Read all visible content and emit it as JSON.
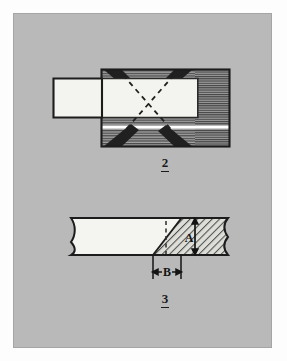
{
  "drawing": {
    "title": "Joint construction detail",
    "background_color": "#b9b9b9",
    "page_color": "#fdfdfd",
    "ink_color": "#1a1a1a",
    "figures": [
      {
        "id": "figure-2",
        "label": "2",
        "caption_underlined": true,
        "view": "plan section of mortise socket with inserted tongue",
        "parts": [
          {
            "name": "socket-body",
            "fill": "horizontal-hatch",
            "color": "#8f8f8f"
          },
          {
            "name": "end-grain-block",
            "fill": "dense-horizontal-hatch",
            "color": "#8a8a8a"
          },
          {
            "name": "tongue",
            "fill": "solid-white",
            "color": "#f2f2ee"
          },
          {
            "name": "glue-line",
            "fill": "white-line",
            "color": "#ffffff"
          }
        ],
        "annotations": [
          {
            "name": "dashed-cross-lines",
            "style": "dashed",
            "count": 2
          },
          {
            "name": "dark-diagonal-wedges",
            "count": 4,
            "color": "#242424"
          }
        ]
      },
      {
        "id": "figure-3",
        "label": "3",
        "caption_underlined": true,
        "view": "side elevation of scarf joint with break lines",
        "parts": [
          {
            "name": "plain-member",
            "fill": "solid-white",
            "color": "#f4f4f0"
          },
          {
            "name": "scarfed-member",
            "fill": "diagonal-hatch",
            "color": "#dcdcd6"
          }
        ],
        "annotations": [
          {
            "name": "break-line-left",
            "style": "s-curve"
          },
          {
            "name": "break-line-right",
            "style": "s-curve"
          },
          {
            "name": "hidden-edge-line",
            "style": "dashed"
          }
        ],
        "dimensions": [
          {
            "name": "dimension-a",
            "label": "A",
            "orientation": "vertical",
            "arrows": "both-ends"
          },
          {
            "name": "dimension-b",
            "label": "B",
            "orientation": "horizontal",
            "arrows": "both-ends-inward"
          }
        ]
      }
    ]
  }
}
